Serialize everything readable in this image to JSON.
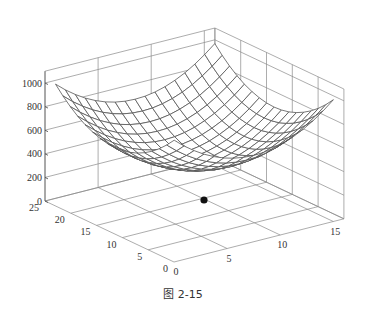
{
  "caption": "图 2-15",
  "chart_data": {
    "type": "surface",
    "title": "",
    "xlabel": "",
    "ylabel": "",
    "zlabel": "",
    "x_ticks": [
      "0",
      "5",
      "10",
      "15"
    ],
    "y_ticks": [
      "0",
      "5",
      "10",
      "15",
      "20",
      "25"
    ],
    "z_ticks": [
      "0",
      "200",
      "400",
      "600",
      "800",
      "1000"
    ],
    "xlim": [
      0,
      16
    ],
    "ylim": [
      0,
      25
    ],
    "zlim": [
      0,
      1100
    ],
    "grid": true,
    "surface": {
      "mesh_rows": 16,
      "mesh_cols": 16,
      "x_range": [
        0.5,
        15.5
      ],
      "y_range": [
        1,
        24
      ],
      "center": [
        8,
        12.5
      ],
      "min_z": 400,
      "max_z": 1000,
      "color": "#555555"
    },
    "marker_point": {
      "x": 8,
      "y": 12.5,
      "z": 0,
      "color": "#111111"
    }
  }
}
